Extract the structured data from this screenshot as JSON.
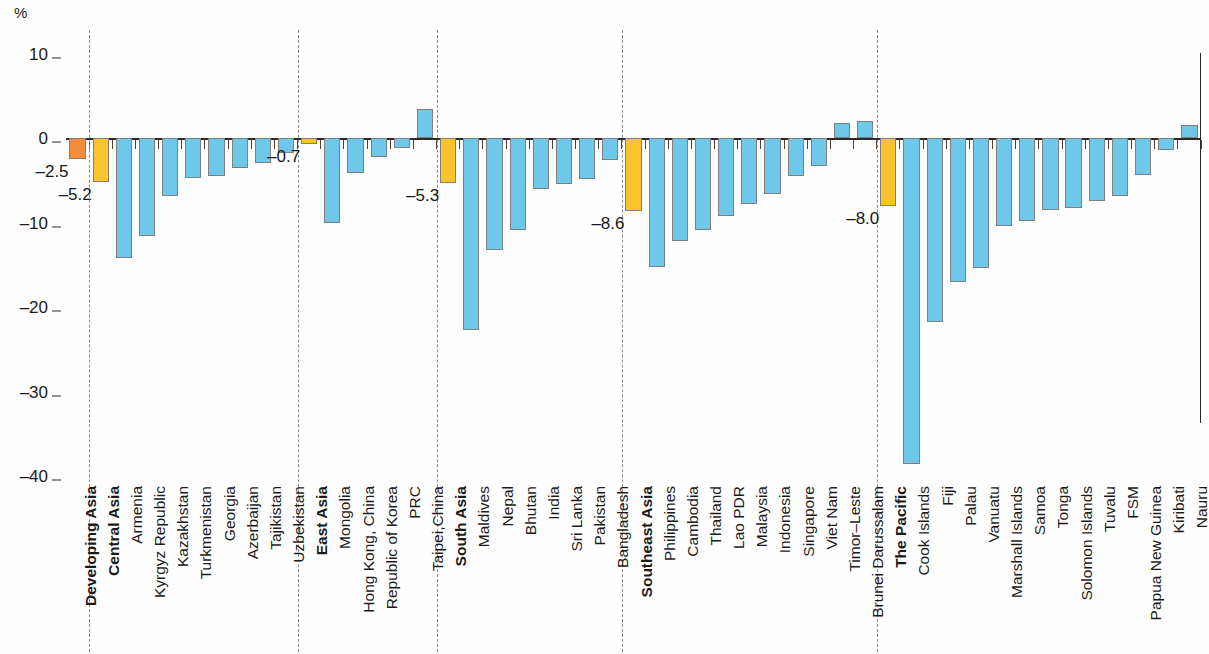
{
  "axis": {
    "unit_symbol": "%",
    "y_ticks": [
      10,
      0,
      -10,
      -20,
      -30,
      -40
    ],
    "y_tick_labels": [
      "10",
      "0",
      "–10",
      "–20",
      "–30",
      "–40"
    ],
    "ylim": [
      10,
      -42
    ]
  },
  "colors": {
    "developing_asia": "#f38d3c",
    "subregion": "#f7c42e",
    "economy": "#6fc8ea",
    "axis": "#2b2b2b",
    "separator": "#8c8c8c"
  },
  "callouts": [
    {
      "label": "–2.5",
      "category": "Developing Asia"
    },
    {
      "label": "–5.2",
      "category": "Central Asia"
    },
    {
      "label": "–0.7",
      "category": "East Asia"
    },
    {
      "label": "–5.3",
      "category": "South Asia"
    },
    {
      "label": "–8.6",
      "category": "Southeast Asia"
    },
    {
      "label": "–8.0",
      "category": "The Pacific"
    }
  ],
  "chart_data": {
    "type": "bar",
    "title": "",
    "subtitle": "",
    "xlabel": "",
    "ylabel": "%",
    "ylim": [
      -42,
      10
    ],
    "grid": false,
    "legend": null,
    "orientation": "vertical",
    "categories": [
      "Developing Asia",
      "Central Asia",
      "Armenia",
      "Kyrgyz Republic",
      "Kazakhstan",
      "Turkmenistan",
      "Georgia",
      "Azerbaijan",
      "Tajikistan",
      "Uzbekistan",
      "East Asia",
      "Mongolia",
      "Hong Kong, China",
      "Republic of Korea",
      "PRC",
      "Taipei,China",
      "South Asia",
      "Maldives",
      "Nepal",
      "Bhutan",
      "India",
      "Sri Lanka",
      "Pakistan",
      "Bangladesh",
      "Southeast Asia",
      "Philippines",
      "Cambodia",
      "Thailand",
      "Lao PDR",
      "Malaysia",
      "Indonesia",
      "Singapore",
      "Viet Nam",
      "Timor–Leste",
      "Brunei Darussalam",
      "The Pacific",
      "Cook Islands",
      "Fiji",
      "Palau",
      "Vanuatu",
      "Marshall Islands",
      "Samoa",
      "Tonga",
      "Solomon Islands",
      "Tuvalu",
      "FSM",
      "Papua New Guinea",
      "Kiribati",
      "Nauru"
    ],
    "values": [
      -2.5,
      -5.2,
      -14.2,
      -11.6,
      -6.9,
      -4.7,
      -4.5,
      -3.5,
      -3.0,
      -1.8,
      -0.7,
      -10.1,
      -4.1,
      -2.2,
      -1.2,
      3.4,
      -5.3,
      -22.7,
      -13.3,
      -10.9,
      -6.0,
      -5.4,
      -4.8,
      -2.6,
      -8.6,
      -15.3,
      -12.2,
      -10.9,
      -9.2,
      -7.8,
      -6.6,
      -4.5,
      -3.3,
      1.8,
      2.0,
      -8.0,
      -38.6,
      -21.8,
      -17.1,
      -15.4,
      -10.4,
      -9.8,
      -8.5,
      -8.3,
      -7.5,
      -6.9,
      -4.4,
      -1.4,
      1.5
    ],
    "bar_kinds": [
      "developing_asia",
      "subregion",
      "economy",
      "economy",
      "economy",
      "economy",
      "economy",
      "economy",
      "economy",
      "economy",
      "subregion",
      "economy",
      "economy",
      "economy",
      "economy",
      "economy",
      "subregion",
      "economy",
      "economy",
      "economy",
      "economy",
      "economy",
      "economy",
      "economy",
      "subregion",
      "economy",
      "economy",
      "economy",
      "economy",
      "economy",
      "economy",
      "economy",
      "economy",
      "economy",
      "economy",
      "subregion",
      "economy",
      "economy",
      "economy",
      "economy",
      "economy",
      "economy",
      "economy",
      "economy",
      "economy",
      "economy",
      "economy",
      "economy",
      "economy"
    ],
    "groups": [
      {
        "name": "Developing Asia",
        "start": 0,
        "count": 1
      },
      {
        "name": "Central Asia",
        "start": 1,
        "count": 9
      },
      {
        "name": "East Asia",
        "start": 10,
        "count": 6
      },
      {
        "name": "South Asia",
        "start": 16,
        "count": 8
      },
      {
        "name": "Southeast Asia",
        "start": 24,
        "count": 11
      },
      {
        "name": "The Pacific",
        "start": 35,
        "count": 14
      }
    ]
  }
}
